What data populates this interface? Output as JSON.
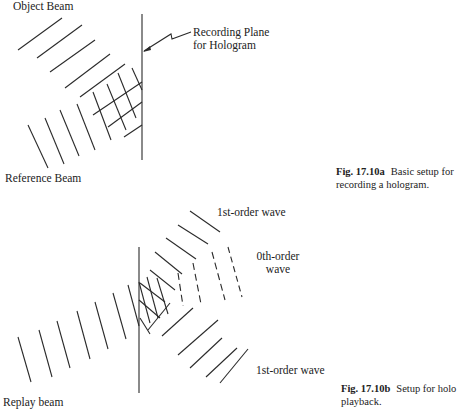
{
  "figure_a": {
    "labels": {
      "object_beam": "Object Beam",
      "recording_plane_line1": "Recording Plane",
      "recording_plane_line2": "for Hologram",
      "reference_beam": "Reference Beam"
    },
    "caption": {
      "number": "Fig. 17.10a",
      "text_line1": "Basic setup for",
      "text_line2": "recording a hologram."
    }
  },
  "figure_b": {
    "labels": {
      "first_order_top": "1st-order wave",
      "zeroth_order_line1": "0th-order",
      "zeroth_order_line2": "wave",
      "first_order_bottom": "1st-order wave",
      "replay_beam": "Replay beam"
    },
    "caption": {
      "number": "Fig. 17.10b",
      "text_line1": "Setup for holo",
      "text_line2": "playback."
    }
  },
  "colors": {
    "line": "#2a2a2a",
    "background": "#ffffff",
    "text": "#222222"
  }
}
